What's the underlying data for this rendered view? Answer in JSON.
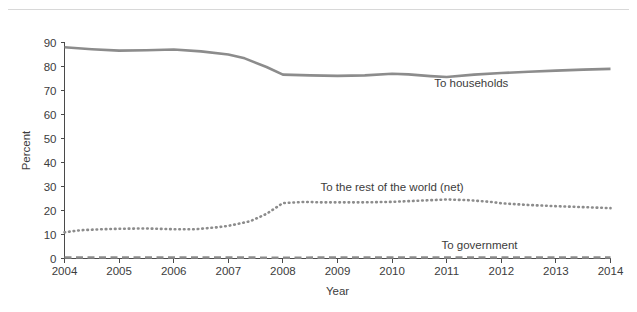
{
  "figure": {
    "caption_sliver": "",
    "has_top_rule": true
  },
  "chart_data": {
    "type": "line",
    "title": "",
    "xlabel": "Year",
    "ylabel": "Percent",
    "x": [
      2004,
      2005,
      2006,
      2007,
      2008,
      2009,
      2010,
      2011,
      2012,
      2013,
      2014
    ],
    "xlim": [
      2004,
      2014
    ],
    "ylim": [
      0,
      90
    ],
    "ytick_labels": [
      "0",
      "10",
      "20",
      "30",
      "40",
      "50",
      "60",
      "70",
      "80",
      "90"
    ],
    "yticks": [
      0,
      10,
      20,
      30,
      40,
      50,
      60,
      70,
      80,
      90
    ],
    "xtick_labels": [
      "2004",
      "2005",
      "2006",
      "2007",
      "2008",
      "2009",
      "2010",
      "2011",
      "2012",
      "2013",
      "2014"
    ],
    "grid": false,
    "legend_position": "inline-right",
    "series": [
      {
        "name": "To households",
        "label": "To households",
        "style": "solid",
        "color": "#8c8c8c",
        "width": 2.6,
        "label_x": 2011.45,
        "label_y": 71.5,
        "values": [
          88.0,
          86.6,
          87.1,
          85.0,
          76.6,
          76.1,
          77.0,
          75.6,
          77.3,
          78.3,
          79.0
        ],
        "dense_x": [
          2004.0,
          2004.5,
          2005.0,
          2005.5,
          2006.0,
          2006.5,
          2007.0,
          2007.3,
          2007.7,
          2008.0,
          2008.5,
          2009.0,
          2009.5,
          2010.0,
          2010.3,
          2010.7,
          2011.0,
          2011.5,
          2012.0,
          2012.5,
          2013.0,
          2013.5,
          2014.0
        ],
        "dense_y": [
          88.0,
          87.2,
          86.6,
          86.8,
          87.1,
          86.3,
          85.0,
          83.4,
          79.8,
          76.6,
          76.3,
          76.1,
          76.3,
          77.0,
          76.7,
          76.0,
          75.6,
          76.6,
          77.3,
          77.8,
          78.3,
          78.7,
          79.0
        ]
      },
      {
        "name": "To the rest of the world (net)",
        "label": "To the rest of the world (net)",
        "style": "dotted",
        "color": "#8c8c8c",
        "width": 2.6,
        "label_x": 2010.0,
        "label_y": 28.2,
        "values": [
          10.9,
          12.4,
          12.2,
          13.6,
          23.1,
          23.4,
          23.6,
          24.6,
          23.0,
          21.8,
          21.0
        ],
        "dense_x": [
          2004.0,
          2004.3,
          2004.7,
          2005.0,
          2005.5,
          2006.0,
          2006.4,
          2006.8,
          2007.0,
          2007.4,
          2007.7,
          2008.0,
          2008.4,
          2008.7,
          2009.0,
          2009.5,
          2010.0,
          2010.5,
          2011.0,
          2011.4,
          2011.8,
          2012.0,
          2012.5,
          2013.0,
          2013.5,
          2014.0
        ],
        "dense_y": [
          10.9,
          11.8,
          12.2,
          12.4,
          12.5,
          12.2,
          12.2,
          13.0,
          13.6,
          15.5,
          18.6,
          23.1,
          23.6,
          23.4,
          23.4,
          23.4,
          23.6,
          24.1,
          24.6,
          24.3,
          23.6,
          23.0,
          22.3,
          21.8,
          21.4,
          21.0
        ]
      },
      {
        "name": "To government",
        "label": "To government",
        "style": "dashed",
        "color": "#8c8c8c",
        "width": 2.6,
        "label_x": 2011.6,
        "label_y": 4.0,
        "values": [
          0.4,
          0.4,
          0.4,
          0.4,
          0.3,
          0.4,
          0.4,
          0.4,
          0.4,
          0.4,
          0.4
        ],
        "dense_x": [
          2004.0,
          2005.0,
          2006.0,
          2007.0,
          2008.0,
          2009.0,
          2010.0,
          2011.0,
          2012.0,
          2013.0,
          2014.0
        ],
        "dense_y": [
          0.4,
          0.4,
          0.4,
          0.4,
          0.3,
          0.4,
          0.4,
          0.4,
          0.4,
          0.4,
          0.4
        ]
      }
    ]
  }
}
